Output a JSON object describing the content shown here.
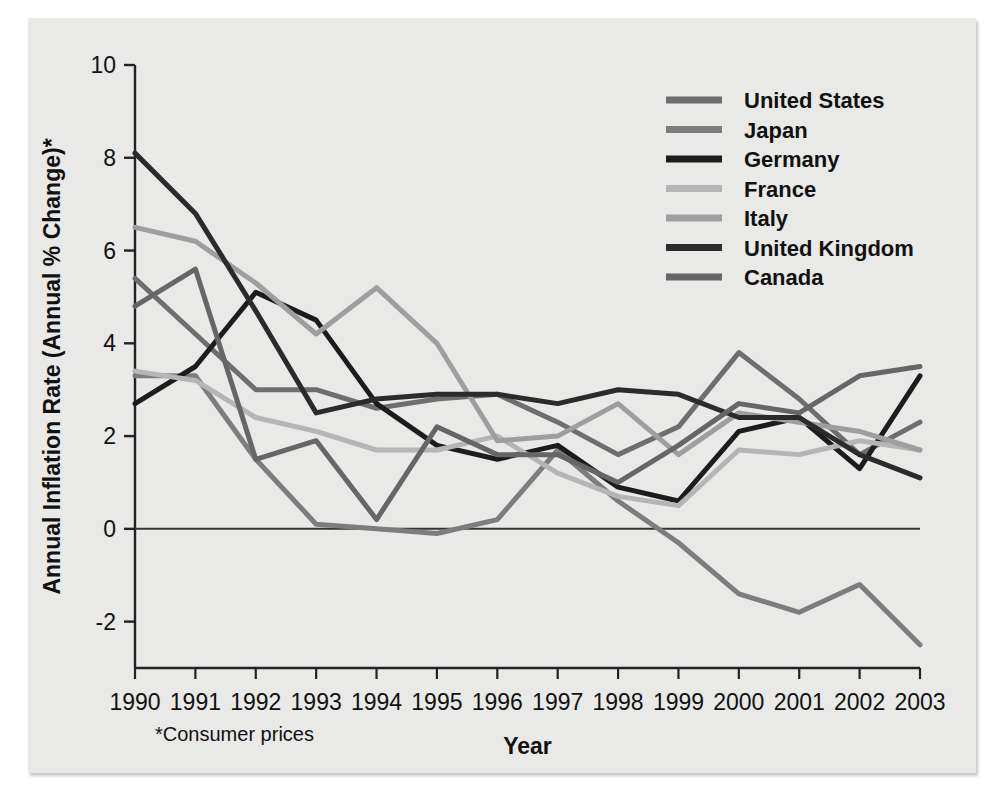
{
  "figure": {
    "footnote": "*Consumer prices",
    "background_color": "#e9e9e7"
  },
  "chart_data": {
    "type": "line",
    "title": "",
    "xlabel": "Year",
    "ylabel": "Annual Inflation Rate (Annual % Change)*",
    "x": [
      1990,
      1991,
      1992,
      1993,
      1994,
      1995,
      1996,
      1997,
      1998,
      1999,
      2000,
      2001,
      2002,
      2003
    ],
    "categories": [
      "1990",
      "1991",
      "1992",
      "1993",
      "1994",
      "1995",
      "1996",
      "1997",
      "1998",
      "1999",
      "2000",
      "2001",
      "2002",
      "2003"
    ],
    "xlim": [
      1990,
      2003
    ],
    "ylim": [
      -3,
      10
    ],
    "yticks": [
      -2,
      0,
      2,
      4,
      6,
      8,
      10
    ],
    "ytick_labels": [
      "-2",
      "0",
      "2",
      "4",
      "6",
      "8",
      "10"
    ],
    "grid": false,
    "zero_line": true,
    "legend_position": "top-right",
    "series": [
      {
        "name": "United States",
        "color": "#6e6e6e",
        "width": 5,
        "values": [
          5.4,
          4.2,
          3.0,
          3.0,
          2.6,
          2.8,
          2.9,
          2.3,
          1.6,
          2.2,
          3.8,
          2.8,
          1.6,
          2.3
        ]
      },
      {
        "name": "Japan",
        "color": "#7d7d7d",
        "width": 5,
        "values": [
          3.3,
          3.3,
          1.5,
          0.1,
          0.0,
          -0.1,
          0.2,
          1.7,
          0.6,
          -0.3,
          -1.4,
          -1.8,
          -1.2,
          -2.5
        ]
      },
      {
        "name": "Germany",
        "color": "#1c1c1c",
        "width": 5,
        "values": [
          2.7,
          3.5,
          5.1,
          4.5,
          2.7,
          1.8,
          1.5,
          1.8,
          0.9,
          0.6,
          2.1,
          2.4,
          1.3,
          3.3
        ]
      },
      {
        "name": "France",
        "color": "#b5b5b5",
        "width": 5,
        "values": [
          3.4,
          3.2,
          2.4,
          2.1,
          1.7,
          1.7,
          2.0,
          1.2,
          0.7,
          0.5,
          1.7,
          1.6,
          1.9,
          1.7
        ]
      },
      {
        "name": "Italy",
        "color": "#9e9e9e",
        "width": 5,
        "values": [
          6.5,
          6.2,
          5.3,
          4.2,
          5.2,
          4.0,
          1.9,
          2.0,
          2.7,
          1.6,
          2.5,
          2.3,
          2.1,
          1.7
        ]
      },
      {
        "name": "United Kingdom",
        "color": "#2b2b2b",
        "width": 5,
        "values": [
          8.1,
          6.8,
          4.7,
          2.5,
          2.8,
          2.9,
          2.9,
          2.7,
          3.0,
          2.9,
          2.4,
          2.4,
          1.6,
          1.1
        ]
      },
      {
        "name": "Canada",
        "color": "#666666",
        "width": 5,
        "values": [
          4.8,
          5.6,
          1.5,
          1.9,
          0.2,
          2.2,
          1.6,
          1.6,
          1.0,
          1.8,
          2.7,
          2.5,
          3.3,
          3.5
        ]
      }
    ]
  }
}
